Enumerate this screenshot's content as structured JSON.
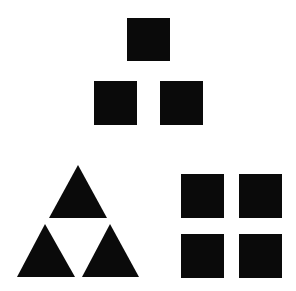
{
  "diagram": {
    "background": "#ffffff",
    "fill": "#0a0a0a",
    "groups": [
      {
        "name": "square-pyramid",
        "shape": "square",
        "count": 3,
        "items": [
          {
            "x": 127,
            "y": 18,
            "w": 43,
            "h": 43
          },
          {
            "x": 94,
            "y": 81,
            "w": 43,
            "h": 44
          },
          {
            "x": 160,
            "y": 81,
            "w": 43,
            "h": 44
          }
        ]
      },
      {
        "name": "triangle-pyramid",
        "shape": "triangle",
        "count": 3,
        "items": [
          {
            "points": "78,165 107,218 49,218"
          },
          {
            "points": "45,224 75,277 17,277"
          },
          {
            "points": "110,224 139,277 82,277"
          }
        ]
      },
      {
        "name": "square-grid",
        "shape": "square",
        "count": 4,
        "items": [
          {
            "x": 181,
            "y": 174,
            "w": 43,
            "h": 44
          },
          {
            "x": 239,
            "y": 174,
            "w": 43,
            "h": 44
          },
          {
            "x": 181,
            "y": 234,
            "w": 43,
            "h": 44
          },
          {
            "x": 239,
            "y": 234,
            "w": 43,
            "h": 44
          }
        ]
      }
    ]
  }
}
